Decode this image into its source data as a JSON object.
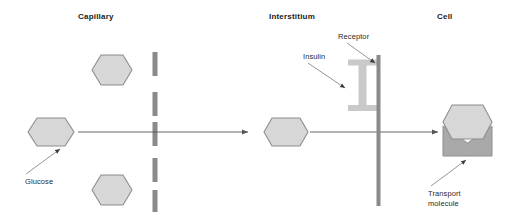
{
  "figure": {
    "width": 518,
    "height": 219,
    "background": "#ffffff"
  },
  "regions": [
    {
      "id": "capillary",
      "label": "Capillary"
    },
    {
      "id": "interstitium",
      "label": "Interstitium"
    },
    {
      "id": "cell",
      "label": "Cell"
    }
  ],
  "callouts": [
    {
      "id": "glucose",
      "label": "Glucose"
    },
    {
      "id": "insulin",
      "label": "Insulin"
    },
    {
      "id": "receptor",
      "label": "Receptor"
    },
    {
      "id": "transport",
      "label": "Transport\nmolecule"
    }
  ],
  "colors": {
    "hexagon_fill": "#d7d7d7",
    "hexagon_stroke": "#8e8e8e",
    "dashed_membrane": "#8a8a8a",
    "cell_membrane": "#8a8a8a",
    "receptor_fill": "#c9c9c9",
    "transport_fill": "#a9a9a9",
    "transport_stroke": "#8e8e8e",
    "arrow": "#555555",
    "leader_line": "#7a7a7a",
    "text": "#1a1a1a"
  },
  "shapes": {
    "glucose_hexagons": [
      {
        "id": "capillary-glucose-top",
        "cx": 112,
        "cy": 70,
        "rx": 27,
        "ry": 15
      },
      {
        "id": "capillary-glucose-middle",
        "cx": 51,
        "cy": 132,
        "rx": 24,
        "ry": 14
      },
      {
        "id": "capillary-glucose-bottom",
        "cx": 112,
        "cy": 190,
        "rx": 27,
        "ry": 15
      },
      {
        "id": "interstitium-glucose",
        "cx": 286,
        "cy": 132,
        "rx": 22,
        "ry": 14
      },
      {
        "id": "cell-bound-glucose",
        "cx": 467,
        "cy": 122,
        "rx": 25,
        "ry": 17
      }
    ],
    "dashed_membrane": {
      "x": 155,
      "y_top": 52,
      "y_bottom": 212,
      "dash_count": 5,
      "width": 5
    },
    "cell_membrane": {
      "x": 378,
      "y_top": 55,
      "y_bottom": 206,
      "width": 4
    },
    "receptor": {
      "x": 348,
      "y": 60,
      "width": 28,
      "height": 50,
      "form": "I-beam"
    },
    "transport_molecule": {
      "x": 443,
      "y": 126,
      "width": 49,
      "height": 30,
      "form": "open-envelope"
    },
    "transport_arrows": [
      {
        "id": "capillary-to-interstitium",
        "x1": 80,
        "y1": 132,
        "x2": 252,
        "y2": 132
      },
      {
        "id": "interstitium-to-cell",
        "x1": 311,
        "y1": 132,
        "x2": 441,
        "y2": 132
      }
    ]
  }
}
